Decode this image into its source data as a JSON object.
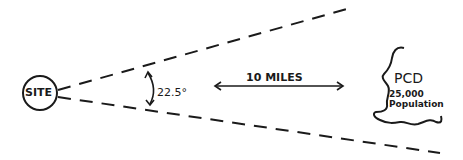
{
  "diagram": {
    "site_label": "SITE",
    "angle_label": "22.5°",
    "distance_label": "10 MILES",
    "population_center": {
      "name": "PCD",
      "population_value": "25,000",
      "population_label": "Population"
    },
    "colors": {
      "ink": "#1a1a1a",
      "background": "#ffffff"
    }
  }
}
